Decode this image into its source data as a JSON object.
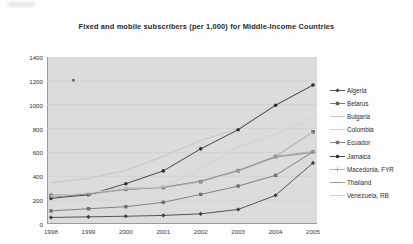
{
  "chart_data": {
    "type": "line",
    "title": "Fixed and mobile subscribers (per 1,000) for Middle-Income Countries",
    "xlabel": "",
    "ylabel": "",
    "grid": true,
    "legend_position": "right",
    "x": [
      "1998",
      "1999",
      "2000",
      "2001",
      "2002",
      "2003",
      "2004",
      "2005"
    ],
    "categories": [
      "1998",
      "1999",
      "2000",
      "2001",
      "2002",
      "2003",
      "2004",
      "2005"
    ],
    "ylim": [
      0,
      1400
    ],
    "yticks": [
      "0",
      "200",
      "400",
      "600",
      "800",
      "1000",
      "1200",
      "1400"
    ],
    "ytick_values": [
      0,
      200,
      400,
      600,
      800,
      1000,
      1200,
      1400
    ],
    "series": [
      {
        "name": "Algeria",
        "color": "#3c3c3c",
        "marker": "diamond",
        "values": [
          55,
          60,
          65,
          72,
          85,
          122,
          240,
          512
        ]
      },
      {
        "name": "Belarus",
        "color": "#5e5e5e",
        "marker": "square",
        "values": [
          240,
          248,
          290,
          305,
          355,
          445,
          565,
          772
        ]
      },
      {
        "name": "Bulgaria",
        "color": "#c8c8c8",
        "marker": "none",
        "values": [
          345,
          382,
          450,
          565,
          700,
          800,
          1000,
          1160
        ]
      },
      {
        "name": "Colombia",
        "color": "#cfcfcf",
        "marker": "none",
        "values": [
          220,
          240,
          300,
          305,
          355,
          440,
          560,
          770
        ]
      },
      {
        "name": "Ecuador",
        "color": "#707070",
        "marker": "square",
        "values": [
          110,
          128,
          145,
          182,
          248,
          318,
          408,
          605
        ]
      },
      {
        "name": "Jamaica",
        "color": "#2e2e2e",
        "marker": "circle",
        "values": [
          215,
          245,
          338,
          445,
          630,
          790,
          995,
          1165
        ]
      },
      {
        "name": "Macedonia, FYR",
        "color": "#a8a8a8",
        "marker": "plus",
        "values": [
          238,
          252,
          292,
          308,
          358,
          450,
          568,
          608
        ]
      },
      {
        "name": "Thailand",
        "color": "#8f8f8f",
        "marker": "dash",
        "values": [
          225,
          252,
          300,
          308,
          360,
          448,
          560,
          600
        ]
      },
      {
        "name": "Venezuela, RB",
        "color": "#d2d2d2",
        "marker": "none",
        "values": [
          232,
          262,
          300,
          310,
          462,
          648,
          755,
          895
        ]
      }
    ],
    "annotations": [
      {
        "name": "stray-marker",
        "x": "1998.6",
        "y": 1205
      }
    ]
  },
  "legend": {
    "items": [
      {
        "label": "Algeria"
      },
      {
        "label": "Belarus"
      },
      {
        "label": "Bulgaria"
      },
      {
        "label": "Colombia"
      },
      {
        "label": "Ecuador"
      },
      {
        "label": "Jamaica"
      },
      {
        "label": "Macedonia, FYR"
      },
      {
        "label": "Thailand"
      },
      {
        "label": "Venezuela, RB"
      }
    ]
  }
}
